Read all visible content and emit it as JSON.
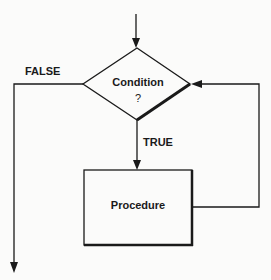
{
  "diagram": {
    "type": "flowchart",
    "colors": {
      "line": "#1a1a1a",
      "background": "#fbfbfa"
    },
    "nodes": [
      {
        "id": "condition",
        "shape": "diamond",
        "label": "Condition",
        "sublabel": "?"
      },
      {
        "id": "procedure",
        "shape": "rectangle",
        "label": "Procedure"
      }
    ],
    "edges": [
      {
        "from": "entry",
        "to": "condition",
        "label": ""
      },
      {
        "from": "condition",
        "to": "procedure",
        "label": "TRUE"
      },
      {
        "from": "procedure",
        "to": "condition",
        "label": "",
        "note": "loop back"
      },
      {
        "from": "condition",
        "to": "exit",
        "label": "FALSE"
      }
    ],
    "labels": {
      "false": "FALSE",
      "true": "TRUE",
      "condition": "Condition",
      "condition_q": "?",
      "procedure": "Procedure"
    }
  }
}
